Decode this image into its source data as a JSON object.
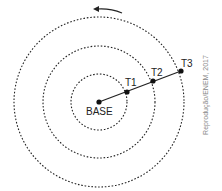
{
  "diagram": {
    "center_label": "BASE",
    "points": [
      {
        "label": "T1"
      },
      {
        "label": "T2"
      },
      {
        "label": "T3"
      }
    ],
    "rotation_direction": "counterclockwise",
    "credit": "Reprodução/ENEM, 2017"
  }
}
